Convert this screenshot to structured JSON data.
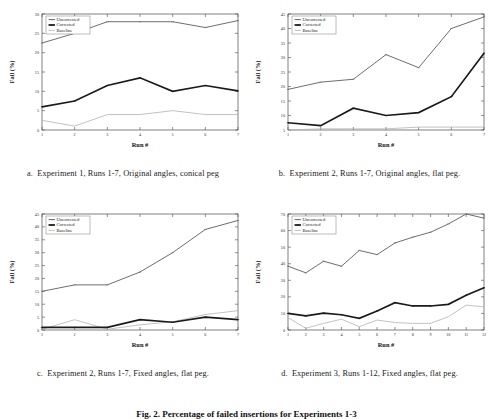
{
  "figure": {
    "caption": "Fig. 2.  Percentage of failed insertions for Experiments 1-3",
    "axis_x_title": "Run #",
    "axis_y_title": "Fail (%)",
    "legend": [
      "Uncorrected",
      "Corrected",
      "Baseline"
    ],
    "colors": {
      "uncorrected": "#6e6e6e",
      "corrected": "#1a1a1a",
      "baseline": "#b3b3b3",
      "axis": "#4a4a4a",
      "background": "#ffffff"
    }
  },
  "panels": [
    {
      "id": "a",
      "letter": "a.",
      "caption": "Experiment 1, Runs 1-7, Original angles, conical peg",
      "chart_data": {
        "type": "line",
        "title": "",
        "xlabel": "Run #",
        "ylabel": "Fail (%)",
        "x": [
          1,
          2,
          3,
          4,
          5,
          6,
          7
        ],
        "xticklabels": [
          "1",
          "2",
          "3",
          "4",
          "5",
          "6",
          "7"
        ],
        "yticks": [
          0,
          5,
          10,
          15,
          20,
          25,
          30
        ],
        "yticklabels": [
          "0",
          "5",
          "10",
          "15",
          "20",
          "25",
          "30"
        ],
        "ylim": [
          0,
          30
        ],
        "xlim": [
          1,
          7
        ],
        "grid": false,
        "legend_position": "top-left",
        "series": [
          {
            "name": "Uncorrected",
            "values": [
              22.5,
              25.0,
              28.0,
              28.0,
              28.0,
              26.5,
              28.3
            ]
          },
          {
            "name": "Corrected",
            "values": [
              6.0,
              7.5,
              11.5,
              13.5,
              10.0,
              11.5,
              10.1
            ]
          },
          {
            "name": "Baseline",
            "values": [
              2.5,
              1.0,
              4.0,
              4.0,
              5.0,
              4.0,
              4.0
            ]
          }
        ]
      }
    },
    {
      "id": "b",
      "letter": "b.",
      "caption": "Experiment 2, Runs 1-7, Original angles, flat peg.",
      "chart_data": {
        "type": "line",
        "title": "",
        "xlabel": "Run #",
        "ylabel": "Fail (%)",
        "x": [
          1,
          2,
          3,
          4,
          5,
          6,
          7
        ],
        "xticklabels": [
          "1",
          "2",
          "3",
          "4",
          "5",
          "6",
          "7"
        ],
        "yticks": [
          5,
          10,
          15,
          20,
          25,
          30,
          35,
          40,
          45
        ],
        "yticklabels": [
          "5",
          "10",
          "15",
          "20",
          "25",
          "30",
          "35",
          "40",
          "45"
        ],
        "ylim": [
          5,
          45
        ],
        "xlim": [
          1,
          7
        ],
        "grid": false,
        "legend_position": "top-left",
        "series": [
          {
            "name": "Uncorrected",
            "values": [
              19.0,
              21.5,
              22.5,
              31.0,
              26.5,
              40.0,
              44.0
            ]
          },
          {
            "name": "Corrected",
            "values": [
              7.5,
              6.5,
              12.5,
              10.0,
              11.0,
              16.5,
              31.5
            ]
          },
          {
            "name": "Baseline",
            "values": [
              5.0,
              5.4,
              5.4,
              5.4,
              6.0,
              6.0,
              6.0
            ]
          }
        ]
      }
    },
    {
      "id": "c",
      "letter": "c.",
      "caption": "Experiment 2, Runs 1-7, Fixed angles, flat peg.",
      "chart_data": {
        "type": "line",
        "title": "",
        "xlabel": "Run #",
        "ylabel": "Fail (%)",
        "x": [
          1,
          2,
          3,
          4,
          5,
          6,
          7
        ],
        "xticklabels": [
          "1",
          "2",
          "3",
          "4",
          "5",
          "6",
          "7"
        ],
        "yticks": [
          0,
          5,
          10,
          15,
          20,
          25,
          30,
          35,
          40,
          45
        ],
        "yticklabels": [
          "0",
          "5",
          "10",
          "15",
          "20",
          "25",
          "30",
          "35",
          "40",
          "45"
        ],
        "ylim": [
          0,
          45
        ],
        "xlim": [
          1,
          7
        ],
        "grid": false,
        "legend_position": "top-left",
        "series": [
          {
            "name": "Uncorrected",
            "values": [
              15.0,
              17.5,
              17.5,
              22.5,
              30.0,
              39.0,
              42.5
            ]
          },
          {
            "name": "Corrected",
            "values": [
              1.0,
              1.0,
              1.0,
              4.0,
              3.0,
              5.0,
              4.0
            ]
          },
          {
            "name": "Baseline",
            "values": [
              0.3,
              4.0,
              0.3,
              2.0,
              3.2,
              6.0,
              7.5
            ]
          }
        ]
      }
    },
    {
      "id": "d",
      "letter": "d.",
      "caption": "Experiment 3, Runs 1-12, Fixed angles, flat peg.",
      "chart_data": {
        "type": "line",
        "title": "",
        "xlabel": "Run #",
        "ylabel": "Fail (%)",
        "x": [
          1,
          2,
          3,
          4,
          5,
          6,
          7,
          8,
          9,
          10,
          11,
          12
        ],
        "xticklabels": [
          "1",
          "2",
          "3",
          "4",
          "5",
          "6",
          "7",
          "8",
          "9",
          "10",
          "11",
          "12"
        ],
        "yticks": [
          0,
          10,
          20,
          30,
          40,
          50,
          60,
          70
        ],
        "yticklabels": [
          "0",
          "10",
          "20",
          "30",
          "40",
          "50",
          "60",
          "70"
        ],
        "ylim": [
          0,
          70
        ],
        "xlim": [
          1,
          12
        ],
        "grid": false,
        "legend_position": "top-left",
        "series": [
          {
            "name": "Uncorrected",
            "values": [
              38.5,
              34.5,
              41.5,
              38.5,
              48.0,
              45.5,
              52.5,
              56.0,
              59.0,
              64.0,
              70.0,
              67.5
            ]
          },
          {
            "name": "Corrected",
            "values": [
              10.0,
              8.5,
              10.2,
              9.2,
              7.0,
              11.5,
              16.5,
              14.5,
              14.5,
              15.5,
              21.0,
              25.5
            ]
          },
          {
            "name": "Baseline",
            "values": [
              7.5,
              1.0,
              4.0,
              6.5,
              2.0,
              6.0,
              4.5,
              4.0,
              4.0,
              8.0,
              15.0,
              14.0
            ]
          }
        ]
      }
    }
  ]
}
